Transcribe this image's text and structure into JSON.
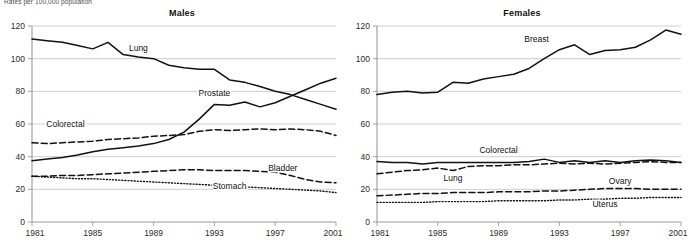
{
  "figure": {
    "axis_note": "Rates per 100,000 population",
    "panels": [
      "Males",
      "Females"
    ]
  },
  "chart_data": [
    {
      "type": "line",
      "title": "Males",
      "xlabel": "",
      "ylabel": "",
      "xlim": [
        1981,
        2001
      ],
      "ylim": [
        0,
        120
      ],
      "yticks": [
        0,
        20,
        40,
        60,
        80,
        100,
        120
      ],
      "xticks": [
        1981,
        1985,
        1989,
        1993,
        1997,
        2001
      ],
      "grid": true,
      "legend": "inline-labels",
      "x": [
        1981,
        1982,
        1983,
        1984,
        1985,
        1986,
        1987,
        1988,
        1989,
        1990,
        1991,
        1992,
        1993,
        1994,
        1995,
        1996,
        1997,
        1998,
        1999,
        2000,
        2001
      ],
      "series": [
        {
          "name": "Lung",
          "style": "solid",
          "label_x": 1988,
          "label_y": 104.5,
          "values": [
            112,
            111,
            110,
            108,
            106,
            110,
            102.5,
            101,
            100,
            96,
            94.5,
            93.5,
            93.5,
            87,
            85.5,
            83,
            80,
            78,
            75,
            72,
            69
          ]
        },
        {
          "name": "Prostate",
          "style": "solid",
          "label_x": 1993,
          "label_y": 77,
          "values": [
            37.5,
            38.5,
            39.5,
            41,
            43,
            44.5,
            45.5,
            46.5,
            48,
            50.5,
            55,
            63,
            72,
            71.5,
            73.5,
            70.5,
            73,
            77,
            81,
            85,
            88
          ]
        },
        {
          "name": "Colorectal",
          "style": "dashed",
          "label_x": 1983.2,
          "label_y": 58,
          "values": [
            48.5,
            48,
            48.5,
            49,
            49.5,
            50.5,
            51,
            51.5,
            52.5,
            53,
            53.5,
            55.5,
            56.5,
            56,
            56.5,
            57,
            56.5,
            57,
            56.5,
            55.5,
            53
          ]
        },
        {
          "name": "Bladder",
          "style": "dashed",
          "label_x": 1997.5,
          "label_y": 31.5,
          "values": [
            28,
            28,
            28.5,
            28.5,
            29,
            29.5,
            30,
            30.5,
            31,
            31.5,
            32,
            32,
            31.5,
            31.5,
            31.5,
            31,
            30.5,
            28.5,
            26,
            24.5,
            24
          ]
        },
        {
          "name": "Stomach",
          "style": "dotted",
          "label_x": 1994,
          "label_y": 20.5,
          "values": [
            28,
            27.5,
            27,
            26.5,
            26.5,
            26,
            25.5,
            25,
            24.5,
            24,
            23.5,
            23,
            22.5,
            22,
            21.5,
            21,
            20.5,
            20,
            19.5,
            19,
            18
          ]
        }
      ]
    },
    {
      "type": "line",
      "title": "Females",
      "xlabel": "",
      "ylabel": "",
      "xlim": [
        1981,
        2001
      ],
      "ylim": [
        0,
        120
      ],
      "yticks": [
        0,
        20,
        40,
        60,
        80,
        100,
        120
      ],
      "xticks": [
        1981,
        1985,
        1989,
        1993,
        1997,
        2001
      ],
      "grid": true,
      "legend": "inline-labels",
      "x": [
        1981,
        1982,
        1983,
        1984,
        1985,
        1986,
        1987,
        1988,
        1989,
        1990,
        1991,
        1992,
        1993,
        1994,
        1995,
        1996,
        1997,
        1998,
        1999,
        2000,
        2001
      ],
      "series": [
        {
          "name": "Breast",
          "style": "solid",
          "label_x": 1991.5,
          "label_y": 110,
          "values": [
            78,
            79.5,
            80,
            79,
            79.5,
            85.5,
            85,
            87.5,
            89,
            90.5,
            94,
            100,
            105.5,
            108.5,
            102.5,
            105,
            105.5,
            107,
            111.5,
            117.5,
            115
          ]
        },
        {
          "name": "Colorectal",
          "style": "solid",
          "label_x": 1989,
          "label_y": 42.5,
          "values": [
            37,
            36.5,
            36.5,
            35.5,
            36.5,
            36.5,
            36.5,
            36.5,
            36.5,
            36.5,
            37,
            38.5,
            36.5,
            37.5,
            36.5,
            37.5,
            36.5,
            37.5,
            38,
            37.5,
            36.5
          ]
        },
        {
          "name": "Lung",
          "style": "dashed",
          "label_x": 1986,
          "label_y": 25,
          "values": [
            29.5,
            30.5,
            31.5,
            32,
            33,
            31.5,
            34,
            34.5,
            34.5,
            35,
            35,
            35.5,
            36,
            35.5,
            36,
            35.5,
            36,
            36.5,
            37,
            36.5,
            36.5
          ]
        },
        {
          "name": "Ovary",
          "style": "dashed",
          "label_x": 1997,
          "label_y": 23.5,
          "values": [
            16,
            16.5,
            17,
            17.5,
            17.5,
            18,
            18,
            18,
            18.5,
            18.5,
            18.5,
            19,
            19,
            19.5,
            20,
            20.5,
            20.5,
            20.5,
            20,
            20,
            20
          ]
        },
        {
          "name": "Uterus",
          "style": "dotted",
          "label_x": 1996,
          "label_y": 9,
          "values": [
            12,
            12,
            12,
            12,
            12.5,
            12.5,
            12.5,
            12.5,
            13,
            13,
            13,
            13,
            13.5,
            13.5,
            14,
            14,
            14.5,
            14.5,
            15,
            15,
            15
          ]
        }
      ]
    }
  ]
}
